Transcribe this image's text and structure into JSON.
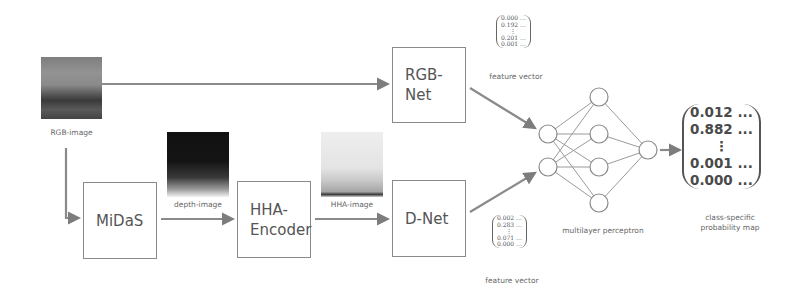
{
  "inputs": {
    "rgb_image_label": "RGB-image",
    "depth_image_label": "depth-image",
    "hha_image_label": "HHA-image"
  },
  "blocks": {
    "midas": "MiDaS",
    "hha_encoder_line1": "HHA-",
    "hha_encoder_line2": "Encoder",
    "rgb_net": "RGB-Net",
    "d_net": "D-Net"
  },
  "feature_vector_top": {
    "label": "feature vector",
    "values": [
      "0.000 ...",
      "0.192 ...",
      "⋮",
      "0.201 ...",
      "0.001 ..."
    ]
  },
  "feature_vector_bottom": {
    "label": "feature vector",
    "values": [
      "0.002 ...",
      "0.283 ...",
      "⋮",
      "0.071 ...",
      "0.000 ..."
    ]
  },
  "mlp": {
    "label": "multilayer perceptron",
    "layers": [
      2,
      4,
      1
    ]
  },
  "output": {
    "label_line1": "class-specific",
    "label_line2": "probability map",
    "values": [
      "0.012 ...",
      "0.882 ...",
      "⋮",
      "0.001 ...",
      "0.000 ..."
    ]
  },
  "colors": {
    "arrow": "#8a8a8a",
    "box_border": "#8a8a8a",
    "text": "#555555"
  }
}
